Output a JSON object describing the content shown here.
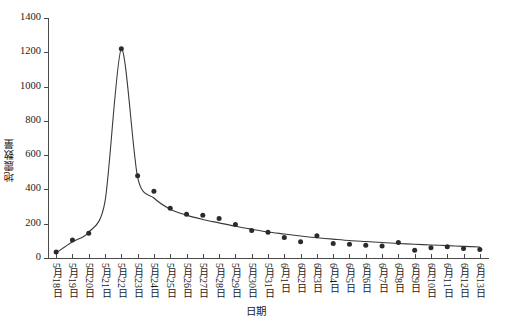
{
  "chart_data": {
    "type": "scatter",
    "title": "",
    "xlabel": "日期",
    "ylabel": "地震数量",
    "ylim": [
      0,
      1400
    ],
    "yticks": [
      0,
      200,
      400,
      600,
      800,
      1000,
      1200,
      1400
    ],
    "grid": false,
    "legend": null,
    "categories": [
      "5月18日",
      "5月19日",
      "5月20日",
      "5月21日",
      "5月22日",
      "5月23日",
      "5月24日",
      "5月25日",
      "5月26日",
      "5月27日",
      "5月28日",
      "5月29日",
      "5月30日",
      "5月31日",
      "6月1日",
      "6月2日",
      "6月3日",
      "6月4日",
      "6月5日",
      "6月6日",
      "6月7日",
      "6月8日",
      "6月9日",
      "6月10日",
      "6月11日",
      "6月12日",
      "6月13日"
    ],
    "series": [
      {
        "name": "地震数量",
        "kind": "points",
        "values": [
          35,
          105,
          145,
          0,
          1220,
          480,
          390,
          290,
          255,
          250,
          230,
          195,
          160,
          150,
          120,
          95,
          130,
          85,
          80,
          75,
          70,
          90,
          45,
          60,
          65,
          55,
          50
        ]
      },
      {
        "name": "拟合曲线",
        "kind": "line",
        "values": [
          30,
          95,
          150,
          330,
          1220,
          470,
          350,
          285,
          250,
          225,
          205,
          185,
          168,
          152,
          140,
          128,
          118,
          110,
          102,
          96,
          90,
          85,
          80,
          76,
          72,
          68,
          64
        ]
      }
    ],
    "marker_color": "#2b2b2b",
    "line_color": "#3a3a3a",
    "axis_color": "#4a4a4a"
  }
}
